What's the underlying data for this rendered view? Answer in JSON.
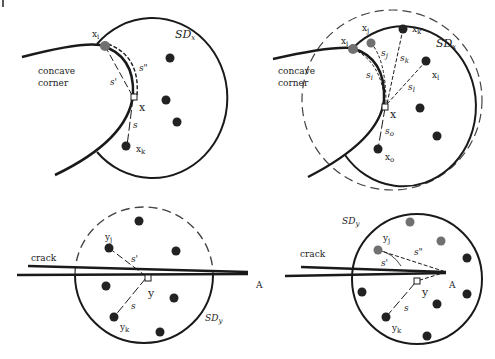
{
  "colors": {
    "stroke": "#1a1a1a",
    "node_dark": "#222222",
    "node_gray": "#707070",
    "dashed_circle": "#444444",
    "background": "#ffffff"
  },
  "panels": {
    "top_left": {
      "region_label_line1": "concave",
      "region_label_line2": "corner",
      "domain_label": "SD",
      "domain_sub": "x",
      "point_x": "x",
      "node_i": "x",
      "node_i_sub": "i",
      "node_k": "x",
      "node_k_sub": "k",
      "dist_s": "s",
      "dist_s_prime": "s'",
      "dist_s_dprime": "s\""
    },
    "top_right": {
      "region_label_line1": "concave",
      "region_label_line2": "corner",
      "domain_label": "SD",
      "domain_sub": "x",
      "point_x": "x",
      "node_i": "x",
      "node_i_sub": "i",
      "node_j": "x",
      "node_j_sub": "j",
      "node_k": "x",
      "node_k_sub": "k",
      "node_l": "x",
      "node_l_sub": "l",
      "node_o": "x",
      "node_o_sub": "o",
      "dist_si": "s",
      "dist_si_sub": "i",
      "dist_sj": "s",
      "dist_sj_sub": "j",
      "dist_sk": "s",
      "dist_sk_sub": "k",
      "dist_sl": "s",
      "dist_sl_sub": "l",
      "dist_so": "s",
      "dist_so_sub": "o"
    },
    "bottom_left": {
      "crack_label": "crack",
      "tip_label": "A",
      "domain_label": "SD",
      "domain_sub": "y",
      "point_y": "y",
      "node_j": "y",
      "node_j_sub": "j",
      "node_k": "y",
      "node_k_sub": "k",
      "dist_s": "s",
      "dist_s_prime": "s'"
    },
    "bottom_right": {
      "crack_label": "crack",
      "tip_label": "A",
      "domain_label": "SD",
      "domain_sub": "y",
      "point_y": "y",
      "node_j": "y",
      "node_j_sub": "j",
      "node_k": "y",
      "node_k_sub": "k",
      "dist_s": "s",
      "dist_s_prime": "s'",
      "dist_s_dprime": "s\""
    }
  }
}
